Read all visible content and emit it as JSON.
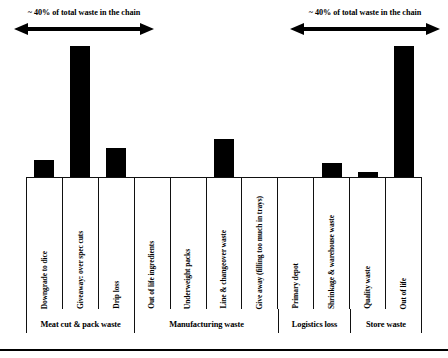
{
  "annotations": [
    {
      "id": "left-annotation",
      "text": "~ 40% of total waste in the chain"
    },
    {
      "id": "right-annotation",
      "text": "~ 40% of total waste in the chain"
    }
  ],
  "chart_data": {
    "type": "bar",
    "title": "",
    "subtitle": "",
    "xlabel": "",
    "ylabel": "",
    "grid": false,
    "legend": "none",
    "bar_color": "#000000",
    "ylim": [
      0,
      100
    ],
    "categories": [
      "Downgrade to dice",
      "Giveaway: over spec cuts",
      "Drip loss",
      "Out of life ingredients",
      "Underweight packs",
      "Line & changeover waste",
      "Give away (filling too much in trays)",
      "Primary depot",
      "Shrinkage & warehouse waste",
      "Quality waste",
      "Out of life"
    ],
    "values": [
      13,
      96,
      22,
      0,
      0,
      28,
      0,
      0,
      11,
      4,
      96
    ],
    "groups": [
      {
        "label": "Meat cut & pack waste",
        "span": 3
      },
      {
        "label": "Manufacturing waste",
        "span": 4
      },
      {
        "label": "Logistics loss",
        "span": 2
      },
      {
        "label": "Store waste",
        "span": 2
      }
    ],
    "annotations": [
      {
        "text": "~ 40% of total waste in the chain",
        "spans_categories": [
          0,
          2
        ]
      },
      {
        "text": "~ 40% of total waste in the chain",
        "spans_categories": [
          8,
          10
        ]
      }
    ]
  }
}
